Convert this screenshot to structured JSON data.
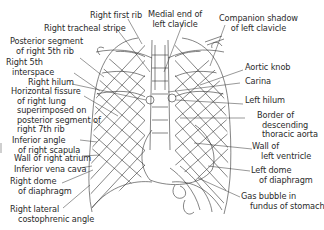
{
  "figure": {
    "labels_left": [
      {
        "id": "right_first_rib",
        "lines": [
          "Right first rib"
        ]
      },
      {
        "id": "right_tracheal_stripe",
        "lines": [
          "Right tracheal stripe"
        ]
      },
      {
        "id": "posterior_segment_5th_rib",
        "lines": [
          "Posterior segment",
          "of right 5th rib"
        ]
      },
      {
        "id": "right_5th_interspace",
        "lines": [
          "Right 5th",
          "interspace"
        ]
      },
      {
        "id": "right_hilum",
        "lines": [
          "Right hilum"
        ]
      },
      {
        "id": "horizontal_fissure",
        "lines": [
          "Horizontal fissure",
          "of right lung",
          "superimposed on",
          "posterior segment of",
          "right 7th rib"
        ]
      },
      {
        "id": "inferior_angle_scapula",
        "lines": [
          "Inferior angle",
          "of right scapula"
        ]
      },
      {
        "id": "wall_right_atrium",
        "lines": [
          "Wall of right atrium"
        ]
      },
      {
        "id": "inferior_vena_cava",
        "lines": [
          "Inferior vena cava"
        ]
      },
      {
        "id": "right_dome_diaphragm",
        "lines": [
          "Right dome",
          "of diaphragm"
        ]
      },
      {
        "id": "right_costophrenic_angle",
        "lines": [
          "Right lateral",
          "costophrenic angle"
        ]
      }
    ],
    "labels_top": [
      {
        "id": "medial_end_left_clavicle",
        "lines": [
          "Medial end of",
          "left clavicle"
        ]
      },
      {
        "id": "companion_shadow",
        "lines": [
          "Companion shadow",
          "of left clavicle"
        ]
      }
    ],
    "labels_right": [
      {
        "id": "aortic_knob",
        "lines": [
          "Aortic knob"
        ]
      },
      {
        "id": "carina",
        "lines": [
          "Carina"
        ]
      },
      {
        "id": "left_hilum",
        "lines": [
          "Left hilum"
        ]
      },
      {
        "id": "descending_aorta",
        "lines": [
          "Border of",
          "descending",
          "thoracic aorta"
        ]
      },
      {
        "id": "wall_left_ventricle",
        "lines": [
          "Wall of",
          "left ventricle"
        ]
      },
      {
        "id": "left_dome_diaphragm",
        "lines": [
          "Left dome",
          "of diaphragm"
        ]
      },
      {
        "id": "gas_bubble",
        "lines": [
          "Gas bubble in",
          "fundus of stomach"
        ]
      }
    ],
    "colors": {
      "line": "#333333",
      "text": "#2b2b2b",
      "background": "#ffffff"
    }
  }
}
